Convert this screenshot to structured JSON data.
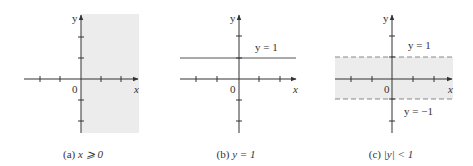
{
  "figure": {
    "panels": [
      {
        "id": "a",
        "caption_prefix": "(a) ",
        "caption_math": "x ⩾ 0",
        "axis_x_label": "x",
        "axis_y_label": "y",
        "origin_label": "0",
        "region": "half-plane x >= 0 shaded"
      },
      {
        "id": "b",
        "caption_prefix": "(b) ",
        "caption_math": "y = 1",
        "axis_x_label": "x",
        "axis_y_label": "y",
        "origin_label": "0",
        "line_label": "y = 1"
      },
      {
        "id": "c",
        "caption_prefix": "(c) ",
        "caption_math": "|y| < 1",
        "axis_x_label": "x",
        "axis_y_label": "y",
        "origin_label": "0",
        "upper_line_label": "y = 1",
        "lower_line_label": "y = −1"
      }
    ],
    "colors": {
      "shade": "#ececec",
      "axis": "#333333",
      "line": "#555555",
      "dashed": "#888888"
    }
  }
}
